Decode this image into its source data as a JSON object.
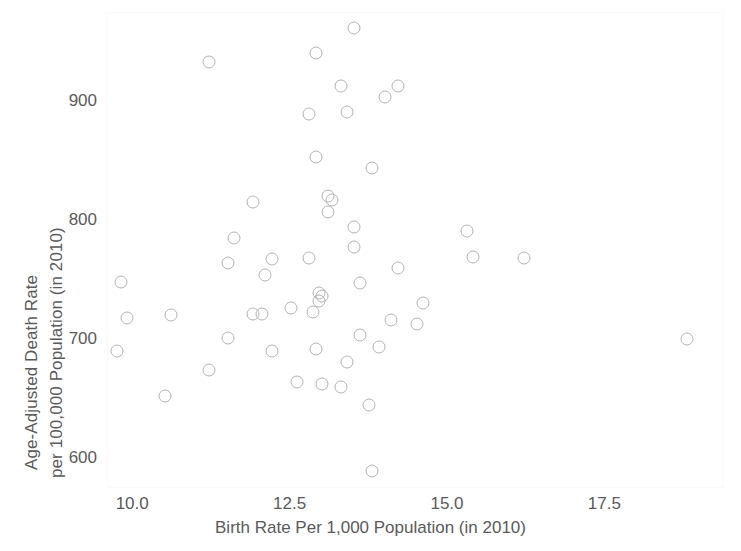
{
  "chart_data": {
    "type": "scatter",
    "title": "",
    "xlabel": "Birth Rate Per 1,000 Population (in 2010)",
    "ylabel_line1": "Age-Adjusted Death Rate",
    "ylabel_line2": "per 100,000 Population (in 2010)",
    "xlim": [
      9.6,
      19.4
    ],
    "ylim": [
      575,
      975
    ],
    "xticks": [
      10.0,
      12.5,
      15.0,
      17.5
    ],
    "xtick_labels": [
      "10.0",
      "12.5",
      "15.0",
      "17.5"
    ],
    "yticks": [
      600,
      700,
      800,
      900
    ],
    "ytick_labels": [
      "600",
      "700",
      "800",
      "900"
    ],
    "grid": false,
    "legend": false,
    "marker": "open-circle",
    "marker_color": "#b4b4b4",
    "points": [
      {
        "x": 13.5,
        "y": 962
      },
      {
        "x": 11.2,
        "y": 934
      },
      {
        "x": 12.9,
        "y": 941
      },
      {
        "x": 13.3,
        "y": 914
      },
      {
        "x": 14.2,
        "y": 914
      },
      {
        "x": 14.0,
        "y": 904
      },
      {
        "x": 12.8,
        "y": 890
      },
      {
        "x": 13.4,
        "y": 892
      },
      {
        "x": 12.9,
        "y": 854
      },
      {
        "x": 13.8,
        "y": 845
      },
      {
        "x": 11.9,
        "y": 816
      },
      {
        "x": 13.1,
        "y": 821
      },
      {
        "x": 13.15,
        "y": 818
      },
      {
        "x": 13.1,
        "y": 808
      },
      {
        "x": 15.3,
        "y": 792
      },
      {
        "x": 13.5,
        "y": 795
      },
      {
        "x": 11.6,
        "y": 786
      },
      {
        "x": 15.4,
        "y": 770
      },
      {
        "x": 16.2,
        "y": 769
      },
      {
        "x": 13.5,
        "y": 778
      },
      {
        "x": 12.8,
        "y": 769
      },
      {
        "x": 12.2,
        "y": 768
      },
      {
        "x": 11.5,
        "y": 765
      },
      {
        "x": 14.2,
        "y": 761
      },
      {
        "x": 12.1,
        "y": 755
      },
      {
        "x": 13.6,
        "y": 748
      },
      {
        "x": 9.8,
        "y": 749
      },
      {
        "x": 12.95,
        "y": 740
      },
      {
        "x": 13.0,
        "y": 737
      },
      {
        "x": 12.95,
        "y": 733
      },
      {
        "x": 14.6,
        "y": 731
      },
      {
        "x": 12.5,
        "y": 727
      },
      {
        "x": 12.85,
        "y": 724
      },
      {
        "x": 11.9,
        "y": 722
      },
      {
        "x": 12.05,
        "y": 722
      },
      {
        "x": 9.9,
        "y": 719
      },
      {
        "x": 10.6,
        "y": 721
      },
      {
        "x": 14.1,
        "y": 717
      },
      {
        "x": 14.5,
        "y": 714
      },
      {
        "x": 13.6,
        "y": 704
      },
      {
        "x": 11.5,
        "y": 702
      },
      {
        "x": 18.8,
        "y": 701
      },
      {
        "x": 13.9,
        "y": 694
      },
      {
        "x": 12.9,
        "y": 693
      },
      {
        "x": 12.2,
        "y": 691
      },
      {
        "x": 9.75,
        "y": 691
      },
      {
        "x": 13.4,
        "y": 682
      },
      {
        "x": 11.2,
        "y": 675
      },
      {
        "x": 12.6,
        "y": 665
      },
      {
        "x": 13.3,
        "y": 661
      },
      {
        "x": 13.0,
        "y": 663
      },
      {
        "x": 10.5,
        "y": 653
      },
      {
        "x": 13.75,
        "y": 646
      },
      {
        "x": 13.8,
        "y": 590
      }
    ]
  }
}
